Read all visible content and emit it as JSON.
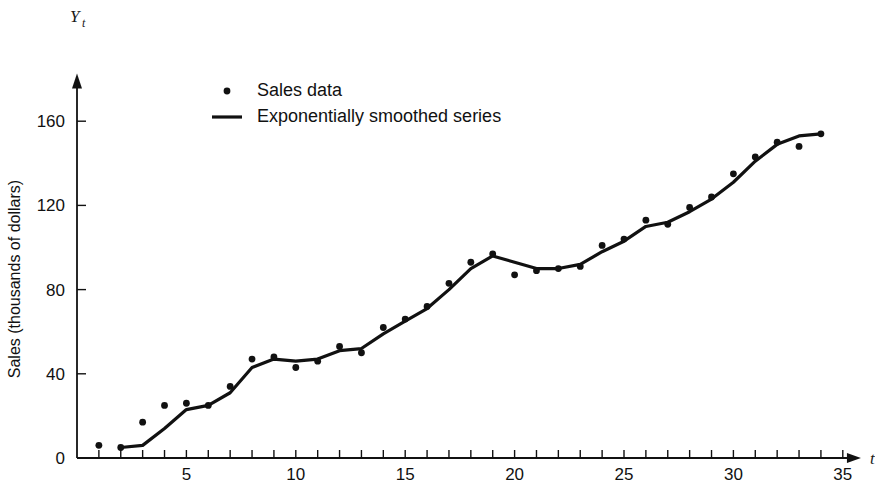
{
  "chart_data": {
    "type": "scatter",
    "title": "",
    "subtitle": "",
    "xlabel": "t",
    "ylabel": "Sales (thousands of dollars)",
    "yaxis_symbol": "Y",
    "yaxis_symbol_subscript": "t",
    "xlim": [
      0,
      35.6
    ],
    "ylim": [
      0,
      176
    ],
    "grid": false,
    "legend_position": "upper-left-inside",
    "x_tick_values": [
      1,
      2,
      3,
      4,
      5,
      6,
      7,
      8,
      9,
      10,
      11,
      12,
      13,
      14,
      15,
      16,
      17,
      18,
      19,
      20,
      21,
      22,
      23,
      24,
      25,
      26,
      27,
      28,
      29,
      30,
      31,
      32,
      33,
      34,
      35
    ],
    "x_tick_labels": [
      {
        "value": 5,
        "label": "5"
      },
      {
        "value": 10,
        "label": "10"
      },
      {
        "value": 15,
        "label": "15"
      },
      {
        "value": 20,
        "label": "20"
      },
      {
        "value": 25,
        "label": "25"
      },
      {
        "value": 30,
        "label": "30"
      },
      {
        "value": 35,
        "label": "35"
      }
    ],
    "y_tick_values": [
      0,
      40,
      80,
      120,
      160
    ],
    "y_tick_labels": [
      "0",
      "40",
      "80",
      "120",
      "160"
    ],
    "series": [
      {
        "name": "Sales data",
        "marker": "dot",
        "color": "#111111",
        "x": [
          1,
          2,
          3,
          4,
          5,
          6,
          7,
          8,
          9,
          10,
          11,
          12,
          13,
          14,
          15,
          16,
          17,
          18,
          19,
          20,
          21,
          22,
          23,
          24,
          25,
          26,
          27,
          28,
          29,
          30,
          31,
          32,
          33,
          34
        ],
        "values": [
          6,
          5,
          17,
          25,
          26,
          25,
          34,
          47,
          48,
          43,
          46,
          53,
          50,
          62,
          66,
          72,
          83,
          93,
          97,
          87,
          89,
          90,
          91,
          101,
          104,
          113,
          111,
          119,
          124,
          135,
          143,
          150,
          148,
          154
        ]
      },
      {
        "name": "Exponentially smoothed series",
        "marker": "line",
        "color": "#111111",
        "x": [
          2,
          3,
          4,
          5,
          6,
          7,
          8,
          9,
          10,
          11,
          12,
          13,
          14,
          15,
          16,
          17,
          18,
          19,
          20,
          21,
          22,
          23,
          24,
          25,
          26,
          27,
          28,
          29,
          30,
          31,
          32,
          33,
          34
        ],
        "values": [
          5,
          6,
          14,
          23,
          25,
          31,
          43,
          47,
          46,
          47,
          51,
          52,
          59,
          65,
          71,
          80,
          90,
          96,
          93,
          90,
          90,
          92,
          98,
          103,
          110,
          112,
          117,
          123,
          131,
          141,
          149,
          153,
          154
        ]
      }
    ],
    "legend": [
      {
        "label": "Sales data",
        "marker": "dot"
      },
      {
        "label": "Exponentially smoothed series",
        "marker": "line"
      }
    ]
  }
}
